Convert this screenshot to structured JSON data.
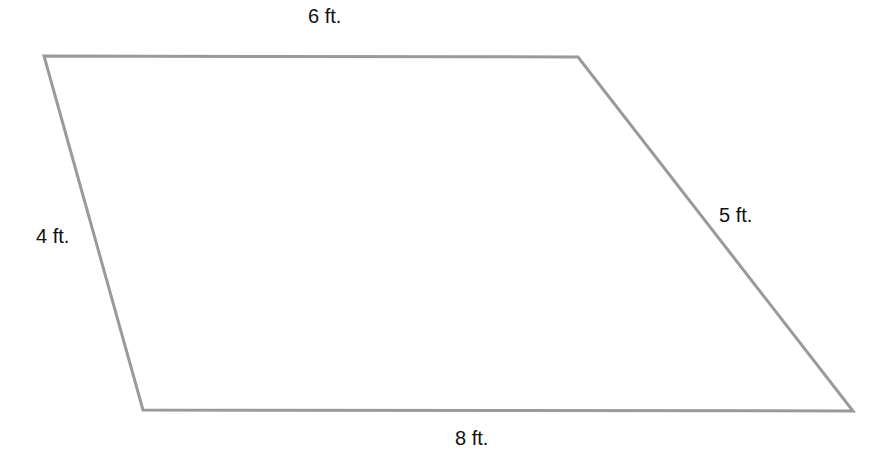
{
  "figure": {
    "type": "quadrilateral",
    "stroke_color": "#9a9a9a",
    "vertices": [
      [
        44,
        56
      ],
      [
        578,
        57
      ],
      [
        853,
        411
      ],
      [
        143,
        410
      ]
    ],
    "labels": {
      "top": "6 ft.",
      "left": "4 ft.",
      "right": "5 ft.",
      "bottom": "8 ft."
    }
  }
}
